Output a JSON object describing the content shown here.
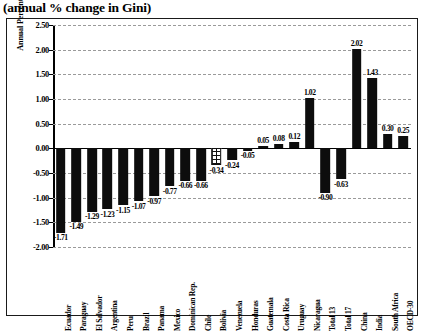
{
  "caption": "(annual % change in Gini)",
  "chart_data": {
    "type": "bar",
    "title": "(annual % change in Gini)",
    "xlabel": "",
    "ylabel": "Annual Percent Change",
    "ylim": [
      -2.0,
      2.5
    ],
    "ytick_step": 0.5,
    "ytick_labels": [
      "2.50",
      "2.00",
      "1.50",
      "1.00",
      "0.50",
      "0.00",
      "-0.50",
      "-1.00",
      "-1.50",
      "-2.00"
    ],
    "ytick_values": [
      2.5,
      2.0,
      1.5,
      1.0,
      0.5,
      0.0,
      -0.5,
      -1.0,
      -1.5,
      -2.0
    ],
    "grid": "horizontal-dashed",
    "legend": "none",
    "categories": [
      "Ecuador",
      "Paraguay",
      "El Salvador",
      "Argentina",
      "Peru",
      "Brazil",
      "Panama",
      "Mexico",
      "Dominican Rep.",
      "Chile",
      "Bolivia",
      "Venezuela",
      "Honduras",
      "Guatemala",
      "Costa Rica",
      "Uruguay",
      "Nicaragua",
      "Total 13",
      "Total 17",
      "China",
      "India",
      "South Africa",
      "OECD-30"
    ],
    "values": [
      -1.71,
      -1.49,
      -1.29,
      -1.23,
      -1.15,
      -1.07,
      -0.97,
      -0.77,
      -0.66,
      -0.66,
      -0.34,
      -0.24,
      -0.05,
      0.05,
      0.08,
      0.12,
      1.02,
      -0.9,
      -0.63,
      2.02,
      1.43,
      0.3,
      0.25
    ],
    "value_labels": [
      "-1.71",
      "-1.49",
      "-1.29",
      "-1.23",
      "-1.15",
      "-1.07",
      "-0.97",
      "-0.77",
      "-0.66",
      "-0.66",
      "-0.34",
      "-0.24",
      "-0.05",
      "0.05",
      "0.08",
      "0.12",
      "1.02",
      "-0.90",
      "-0.63",
      "2.02",
      "1.43",
      "0.30",
      "0.25"
    ],
    "bar_styles": [
      "solid",
      "solid",
      "solid",
      "solid",
      "solid",
      "solid",
      "solid",
      "solid",
      "solid",
      "solid",
      "hatched",
      "solid",
      "solid",
      "solid",
      "solid",
      "solid",
      "solid",
      "solid",
      "solid",
      "solid",
      "solid",
      "solid",
      "solid"
    ],
    "bar_color": "#0d0d0d",
    "hatch_color": "#111111",
    "background": "#ffffff"
  }
}
